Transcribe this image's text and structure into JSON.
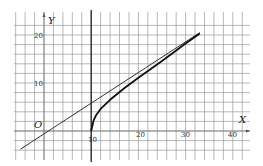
{
  "chart_data": {
    "type": "line",
    "title": "",
    "xlabel": "X",
    "ylabel": "Y",
    "origin_label": "O",
    "xlim": [
      -5,
      43
    ],
    "ylim": [
      -4,
      24
    ],
    "grid": true,
    "x_ticks": [
      10,
      20,
      30,
      40
    ],
    "y_ticks": [
      10,
      20
    ],
    "x_tick_labels": [
      "10",
      "20",
      "30",
      "40"
    ],
    "y_tick_labels": [
      "10",
      "20"
    ],
    "vertical_line": {
      "x": 10
    },
    "series": [
      {
        "name": "asymptote-line",
        "style": "thin",
        "x": [
          -5,
          0,
          10,
          20,
          33
        ],
        "y": [
          -3.8,
          -0.5,
          5.8,
          12.3,
          20.5
        ]
      },
      {
        "name": "curve",
        "style": "thick",
        "x": [
          10,
          10.5,
          11,
          12,
          14,
          17,
          20,
          25,
          30,
          33
        ],
        "y": [
          0,
          2.2,
          3.2,
          4.6,
          6.5,
          8.9,
          11.1,
          14.6,
          18.2,
          20.3
        ]
      }
    ]
  },
  "labels": {
    "x_axis": "X",
    "y_axis": "Y",
    "origin": "O",
    "x10": "10",
    "x20": "20",
    "x30": "30",
    "x40": "40",
    "y10": "10",
    "y20": "20"
  }
}
